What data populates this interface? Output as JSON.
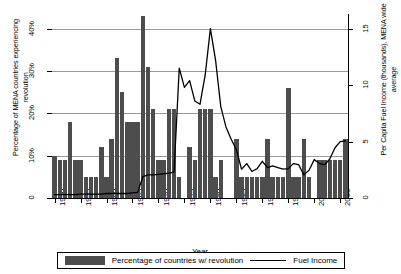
{
  "chart_data": {
    "type": "bar",
    "title": "",
    "xlabel": "Year",
    "ylabel": "Percentage of MENA countries experiencing revolution",
    "ylabel_right": "Per Capita Fuel Income (thousands), MENA wide average",
    "xlim": [
      1949.5,
      2006.5
    ],
    "ylim": [
      0,
      43.5
    ],
    "ylim_right": [
      0,
      16.3
    ],
    "grid": true,
    "legend_position": "bottom",
    "ytick_labels": [
      "0",
      "10%",
      "20%",
      "30%",
      "40%"
    ],
    "ytick_values": [
      0,
      10,
      20,
      30,
      40
    ],
    "ytick_labels_right": [
      "0",
      "5",
      "10",
      "15"
    ],
    "ytick_values_right": [
      0,
      5,
      10,
      15
    ],
    "xtick_labels": [
      "1950",
      "1955",
      "1960",
      "1965",
      "1970",
      "1975",
      "1980",
      "1985",
      "1990",
      "1995",
      "2000",
      "2005"
    ],
    "xtick_values": [
      1950,
      1955,
      1960,
      1965,
      1970,
      1975,
      1980,
      1985,
      1990,
      1995,
      2000,
      2005
    ],
    "x": [
      1950,
      1951,
      1952,
      1953,
      1954,
      1955,
      1956,
      1957,
      1958,
      1959,
      1960,
      1961,
      1962,
      1963,
      1964,
      1965,
      1966,
      1967,
      1968,
      1969,
      1970,
      1971,
      1972,
      1973,
      1974,
      1975,
      1976,
      1977,
      1978,
      1979,
      1980,
      1981,
      1982,
      1983,
      1984,
      1985,
      1986,
      1987,
      1988,
      1989,
      1990,
      1991,
      1992,
      1993,
      1994,
      1995,
      1996,
      1997,
      1998,
      1999,
      2000,
      2001,
      2002,
      2003,
      2004,
      2005,
      2006
    ],
    "series": [
      {
        "name": "Percentage of countries w/ revolution",
        "type": "bar",
        "axis": "left",
        "color": "#4d4d4d",
        "values": [
          10,
          9,
          9,
          18,
          9,
          9,
          5,
          5,
          5,
          12,
          5,
          14,
          33,
          25,
          18,
          18,
          18,
          43,
          31,
          21,
          9,
          9,
          21,
          21,
          5,
          0,
          12,
          9,
          21,
          21,
          21,
          5,
          9,
          0,
          0,
          14,
          5,
          5,
          5,
          5,
          5,
          14,
          5,
          5,
          5,
          26,
          5,
          5,
          14,
          5,
          0,
          9,
          9,
          9,
          9,
          9,
          14
        ]
      },
      {
        "name": "Fuel Income",
        "type": "line",
        "axis": "right",
        "color": "#000000",
        "values": [
          0.3,
          0.3,
          0.3,
          0.3,
          0.3,
          0.35,
          0.35,
          0.35,
          0.35,
          0.35,
          0.4,
          0.4,
          0.4,
          0.4,
          0.4,
          0.45,
          0.5,
          1.9,
          2.05,
          2.05,
          2.1,
          2.15,
          2.2,
          2.3,
          11.5,
          9.8,
          10.4,
          8.6,
          8.3,
          10.9,
          15.0,
          12.2,
          8.1,
          6.3,
          5.2,
          4.3,
          2.55,
          3.05,
          2.35,
          2.6,
          3.25,
          2.7,
          2.85,
          2.7,
          2.55,
          2.6,
          3.05,
          2.95,
          2.05,
          2.45,
          3.4,
          3.05,
          2.95,
          3.45,
          4.45,
          5.0,
          5.05
        ]
      }
    ],
    "legend": [
      {
        "label": "Percentage of countries w/ revolution",
        "marker": "bar-swatch"
      },
      {
        "label": "Fuel Income",
        "marker": "line-swatch"
      }
    ]
  }
}
